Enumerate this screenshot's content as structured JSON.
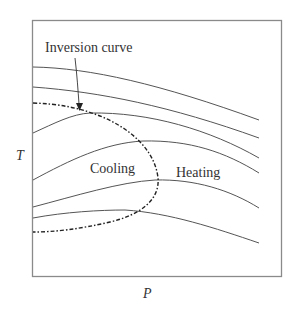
{
  "diagram": {
    "axes": {
      "x_label": "P",
      "y_label": "T"
    },
    "annotations": {
      "inversion_curve": "Inversion curve",
      "cooling": "Cooling",
      "heating": "Heating"
    },
    "colors": {
      "frame": "#8a8a8a",
      "curve": "#555555",
      "dashed": "#222222",
      "text": "#333333"
    },
    "isenthalps": [
      {
        "id": 1,
        "left_y": 67,
        "peak": [
          33,
          67
        ],
        "right": [
          259,
          120
        ]
      },
      {
        "id": 2,
        "left_y": 87,
        "peak": [
          33,
          87
        ],
        "right": [
          259,
          138
        ]
      },
      {
        "id": 3,
        "left_y": 133,
        "peak": [
          90,
          113
        ],
        "right": [
          259,
          158
        ]
      },
      {
        "id": 4,
        "left_y": 180,
        "peak": [
          143,
          141
        ],
        "right": [
          259,
          173
        ]
      },
      {
        "id": 5,
        "left_y": 207,
        "peak": [
          155,
          180
        ],
        "right": [
          259,
          208
        ]
      },
      {
        "id": 6,
        "left_y": 218,
        "peak": [
          125,
          210
        ],
        "right": [
          259,
          243
        ]
      }
    ]
  }
}
